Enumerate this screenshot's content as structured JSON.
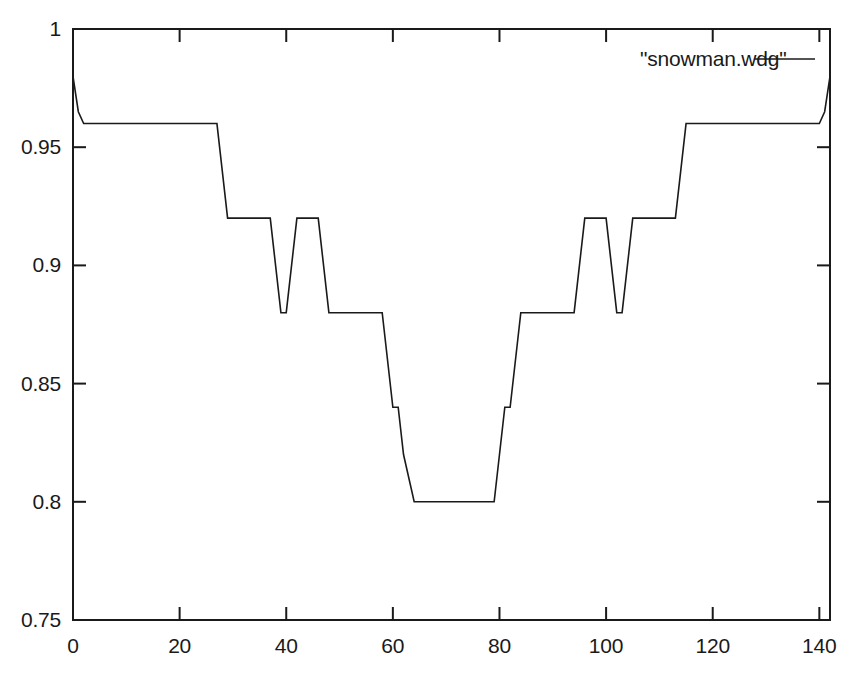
{
  "chart_data": {
    "type": "line",
    "title": "",
    "xlabel": "",
    "ylabel": "",
    "xlim": [
      0,
      142
    ],
    "ylim": [
      0.75,
      1.0
    ],
    "grid": false,
    "legend_position": "top-right",
    "xticks": [
      0,
      20,
      40,
      60,
      80,
      100,
      120,
      140
    ],
    "xtick_labels": [
      "0",
      "20",
      "40",
      "60",
      "80",
      "100",
      "120",
      "140"
    ],
    "yticks": [
      0.75,
      0.8,
      0.85,
      0.9,
      0.95,
      1
    ],
    "ytick_labels": [
      "0.75",
      "0.8",
      "0.85",
      "0.9",
      "0.95",
      "1"
    ],
    "line_color": "#1a1a1a",
    "line_width": 1.6,
    "series": [
      {
        "name": "\"snowman.wdg\"",
        "x": [
          0,
          1,
          2,
          27,
          29,
          37,
          39,
          40,
          42,
          44,
          46,
          48,
          50,
          58,
          60,
          61,
          62,
          64,
          79,
          80,
          81,
          82,
          84,
          92,
          94,
          96,
          98,
          100,
          102,
          103,
          105,
          113,
          115,
          140,
          141,
          142
        ],
        "y": [
          0.98,
          0.965,
          0.96,
          0.96,
          0.92,
          0.92,
          0.88,
          0.88,
          0.92,
          0.92,
          0.92,
          0.88,
          0.88,
          0.88,
          0.84,
          0.84,
          0.82,
          0.8,
          0.8,
          0.82,
          0.84,
          0.84,
          0.88,
          0.88,
          0.88,
          0.92,
          0.92,
          0.92,
          0.88,
          0.88,
          0.92,
          0.92,
          0.96,
          0.96,
          0.965,
          0.98
        ]
      }
    ]
  },
  "legend": {
    "entry_label": "\"snowman.wdg\""
  },
  "axes": {
    "y_labels": [
      "1",
      "0.95",
      "0.9",
      "0.85",
      "0.8",
      "0.75"
    ],
    "x_labels": [
      "0",
      "20",
      "40",
      "60",
      "80",
      "100",
      "120",
      "140"
    ]
  }
}
